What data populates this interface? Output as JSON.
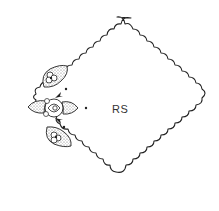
{
  "diagram": {
    "title_label": "RS",
    "colors": {
      "outline": "#222222",
      "fill_stipple": "#bdbdbd",
      "background": "#ffffff",
      "text": "#333333"
    },
    "corners": {
      "top": [
        117,
        17
      ],
      "right": [
        207,
        110
      ],
      "bottom": [
        116,
        202
      ],
      "left": [
        14,
        106
      ]
    },
    "marker_dots": [
      [
        66,
        89
      ],
      [
        86,
        108
      ],
      [
        64,
        127
      ]
    ],
    "motif_parts": [
      "upper-leaf-with-flower",
      "center-rose-with-leaves",
      "lower-leaf-with-flower",
      "upper-arrow",
      "lower-arrow"
    ]
  }
}
